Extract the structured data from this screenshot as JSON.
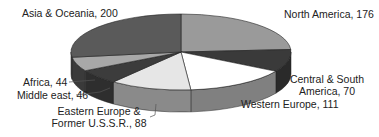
{
  "chart_data": {
    "type": "pie",
    "style": "3d",
    "title": "",
    "categories": [
      "North America",
      "Central & South America",
      "Western Europe",
      "Eastern Europe & Former U.S.S.R.",
      "Middle east",
      "Africa",
      "Asia & Oceania"
    ],
    "values": [
      176,
      70,
      111,
      88,
      46,
      44,
      200
    ],
    "total": 735,
    "labels": [
      {
        "line1": "North America, 176"
      },
      {
        "line1": "Central & South",
        "line2": "America, 70"
      },
      {
        "line1": "Western Europe, 111"
      },
      {
        "line1": "Eastern Europe &",
        "line2": "Former U.S.S.R., 88"
      },
      {
        "line1": "Middle east, 46"
      },
      {
        "line1": "Africa, 44"
      },
      {
        "line1": "Asia & Oceania, 200"
      }
    ],
    "colors": [
      "#9a9a9a",
      "#3a3a3a",
      "#ffffff",
      "#e6e6e6",
      "#3c3c3c",
      "#a8a8a8",
      "#5a5a5a"
    ],
    "side_colors": [
      "#6e6e6e",
      "#2a2a2a",
      "#808080",
      "#8a8a8a",
      "#2e2e2e",
      "#3a3a3a",
      "#444444"
    ],
    "start_angle_deg": 0,
    "direction": "clockwise",
    "legend": "none (data labels)"
  }
}
